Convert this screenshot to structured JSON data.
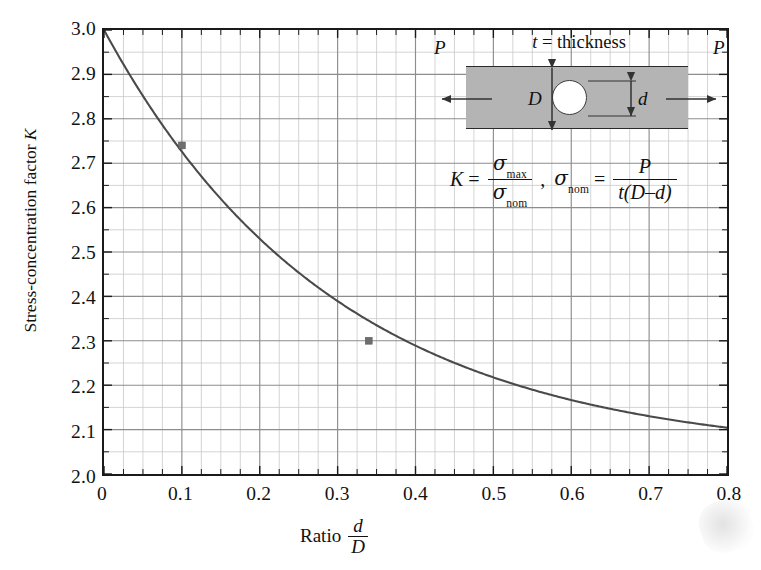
{
  "chart_data": {
    "type": "line",
    "title": "",
    "xlabel": "Ratio d/D",
    "ylabel": "Stress-concentration factor K",
    "xlim": [
      0,
      0.8
    ],
    "ylim": [
      2.0,
      3.0
    ],
    "grid": true,
    "legend": "none",
    "x_major_step": 0.1,
    "x_minor_divisions": 4,
    "y_major_step": 0.1,
    "y_minor_divisions": 2,
    "xticks": [
      "0",
      "0.1",
      "0.2",
      "0.3",
      "0.4",
      "0.5",
      "0.6",
      "0.7",
      "0.8"
    ],
    "xtick_values": [
      0,
      0.1,
      0.2,
      0.3,
      0.4,
      0.5,
      0.6,
      0.7,
      0.8
    ],
    "yticks": [
      "2.0",
      "2.1",
      "2.2",
      "2.3",
      "2.4",
      "2.5",
      "2.6",
      "2.7",
      "2.8",
      "2.9",
      "3.0"
    ],
    "ytick_values": [
      2.0,
      2.1,
      2.2,
      2.3,
      2.4,
      2.5,
      2.6,
      2.7,
      2.8,
      2.9,
      3.0
    ],
    "series": [
      {
        "name": "K vs d/D",
        "color": "#4a4a4a",
        "x": [
          0.0,
          0.025,
          0.05,
          0.075,
          0.1,
          0.125,
          0.15,
          0.175,
          0.2,
          0.225,
          0.25,
          0.275,
          0.3,
          0.325,
          0.35,
          0.375,
          0.4,
          0.425,
          0.45,
          0.475,
          0.5,
          0.525,
          0.55,
          0.575,
          0.6,
          0.625,
          0.65,
          0.675,
          0.7,
          0.725,
          0.75,
          0.775,
          0.8
        ],
        "values": [
          3.0,
          2.935,
          2.873,
          2.807,
          2.74,
          2.676,
          2.614,
          2.553,
          2.494,
          2.44,
          2.5,
          2.44,
          2.387,
          2.339,
          2.292,
          2.25,
          2.212,
          2.178,
          2.147,
          2.2,
          2.17,
          2.145,
          2.123,
          2.107,
          2.1,
          2.085,
          2.073,
          2.064,
          2.057,
          2.051,
          2.047,
          2.044,
          2.042
        ]
      }
    ],
    "markers": [
      {
        "name": "marker-a",
        "x": 0.1,
        "y": 2.74
      },
      {
        "name": "marker-b",
        "x": 0.34,
        "y": 2.3
      }
    ]
  },
  "axes": {
    "ylabel_prefix": "Stress-concentration factor",
    "ylabel_symbol": "K",
    "xlabel_prefix": "Ratio",
    "xlabel_numerator": "d",
    "xlabel_denominator": "D"
  },
  "inset": {
    "caption_symbol": "t",
    "caption_text": "= thickness",
    "label_force_left": "P",
    "label_force_right": "P",
    "label_width": "D",
    "label_hole": "d",
    "bar_color": "#b4b4b4",
    "hole_color": "#ffffff"
  },
  "formula": {
    "k": "K",
    "equals": "=",
    "sigma": "σ",
    "sub_max": "max",
    "sub_nom": "nom",
    "comma": ",",
    "p": "P",
    "denominator": "t(D–d)"
  }
}
